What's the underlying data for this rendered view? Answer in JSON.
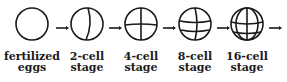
{
  "diagram": {
    "stages": [
      {
        "label_line1": "fertilized",
        "label_line2": "eggs",
        "cells": 1
      },
      {
        "label_line1": "2-cell",
        "label_line2": "stage",
        "cells": 2
      },
      {
        "label_line1": "4-cell",
        "label_line2": "stage",
        "cells": 4
      },
      {
        "label_line1": "8-cell",
        "label_line2": "stage",
        "cells": 8
      },
      {
        "label_line1": "16-cell",
        "label_line2": "stage",
        "cells": 16
      }
    ],
    "stroke_color": "#1a1a1a"
  }
}
